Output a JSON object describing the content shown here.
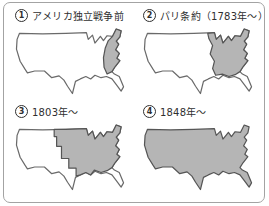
{
  "panels": [
    {
      "number": "1",
      "label": "アメリカ独立戦争前",
      "shaded_region": "eastern-seaboard-thirteen-colonies"
    },
    {
      "number": "2",
      "label": "パリ条約（1783年～）",
      "shaded_region": "east-of-mississippi-river"
    },
    {
      "number": "3",
      "label": "1803年～",
      "shaded_region": "with-louisiana-purchase"
    },
    {
      "number": "4",
      "label": "1848年～",
      "shaded_region": "entire-continental-us"
    }
  ],
  "colors": {
    "territory_fill": "#b5b5b5",
    "map_outline": "#6a6a6a",
    "figure_border": "#a3a3a3",
    "text": "#2f2f2f"
  }
}
